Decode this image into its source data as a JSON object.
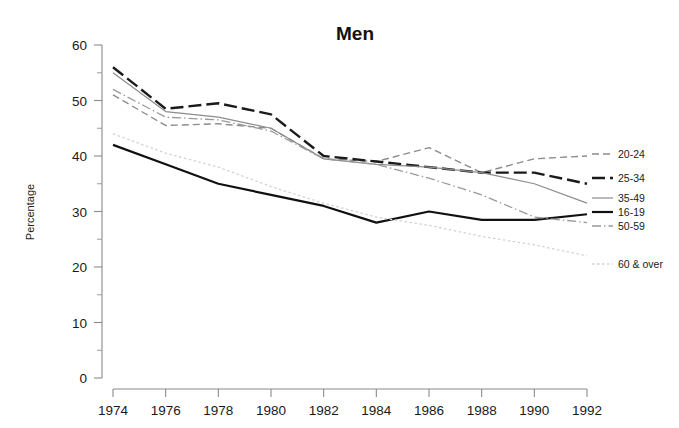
{
  "chart_data": {
    "type": "line",
    "title": "Men",
    "xlabel": "",
    "ylabel": "Percentage",
    "x": [
      1974,
      1976,
      1978,
      1980,
      1982,
      1984,
      1986,
      1988,
      1990,
      1992
    ],
    "xlim": [
      1974,
      1992
    ],
    "ylim": [
      0,
      60
    ],
    "yticks": [
      0,
      10,
      20,
      30,
      40,
      50,
      60
    ],
    "xticks": [
      "1974",
      "1976",
      "1978",
      "1980",
      "1982",
      "1984",
      "1986",
      "1988",
      "1990",
      "1992"
    ],
    "ytick_labels": [
      "0",
      "10",
      "20",
      "30",
      "40",
      "50",
      "60"
    ],
    "grid": false,
    "legend_position": "right",
    "series": [
      {
        "name": "20-24",
        "values": [
          51.0,
          45.5,
          45.8,
          45.0,
          39.5,
          39.0,
          41.5,
          37.0,
          39.5,
          40.0
        ],
        "color": "#8c8c8c",
        "style": "dashed",
        "width": 1.4,
        "label_value": "40.0"
      },
      {
        "name": "25-34",
        "values": [
          56.0,
          48.5,
          49.5,
          47.5,
          40.0,
          39.0,
          38.0,
          37.0,
          37.0,
          35.0
        ],
        "color": "#1a1a1a",
        "style": "dashed-bold",
        "width": 2.4,
        "label_value": "35.0"
      },
      {
        "name": "35-49",
        "values": [
          55.0,
          48.0,
          47.0,
          45.0,
          39.5,
          38.5,
          38.0,
          37.0,
          35.0,
          31.5
        ],
        "color": "#8c8c8c",
        "style": "solid",
        "width": 1.2,
        "label_value": "31.5"
      },
      {
        "name": "16-19",
        "values": [
          42.0,
          38.5,
          35.0,
          33.0,
          31.0,
          28.0,
          30.0,
          28.5,
          28.5,
          29.5
        ],
        "color": "#111111",
        "style": "solid",
        "width": 2.2,
        "label_value": "29.5"
      },
      {
        "name": "50-59",
        "values": [
          52.0,
          47.0,
          46.5,
          44.5,
          39.5,
          38.5,
          36.0,
          33.0,
          29.0,
          28.0
        ],
        "color": "#9a9a9a",
        "style": "dash-dot",
        "width": 1.3,
        "label_value": "28.0"
      },
      {
        "name": "60 & over",
        "values": [
          44.0,
          40.5,
          38.0,
          34.5,
          31.5,
          29.0,
          27.5,
          25.5,
          24.0,
          22.0
        ],
        "color": "#d2d2d2",
        "style": "dotted",
        "width": 1.3,
        "label_value": "22.0"
      }
    ],
    "legend_entries": [
      {
        "label": "20-24",
        "y": 158
      },
      {
        "label": "25-34",
        "y": 182
      },
      {
        "label": "35-49",
        "y": 202
      },
      {
        "label": "16-19",
        "y": 216
      },
      {
        "label": "50-59",
        "y": 230
      },
      {
        "label": "60 & over",
        "y": 268
      }
    ]
  },
  "colors": {
    "background": "#ffffff",
    "axis": "#8a8a8a",
    "title": "#111111"
  }
}
